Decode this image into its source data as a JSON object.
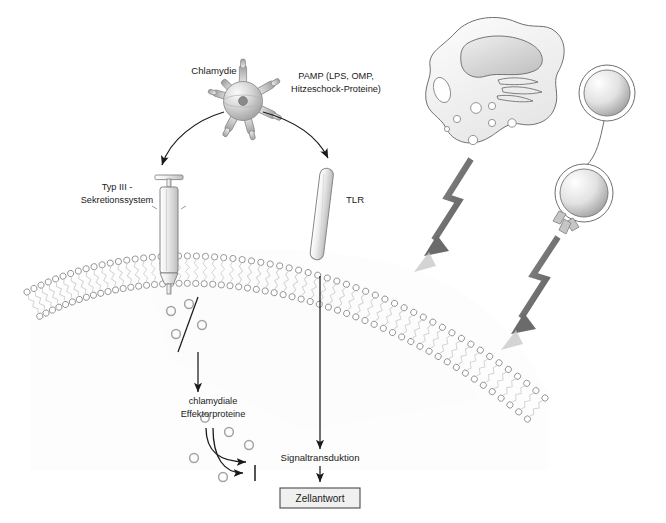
{
  "figure": {
    "language": "de",
    "background_color": "#ffffff",
    "text_color": "#1a1a1a"
  },
  "labels": {
    "chlamydie": "Chlamydie",
    "pamp_line1": "PAMP (LPS, OMP,",
    "pamp_line2": "Hitzeschock-Proteine)",
    "t3ss_line1": "Typ III -",
    "t3ss_line2": "Sekretionssystem",
    "tlr": "TLR",
    "effector_line1": "chlamydiale",
    "effector_line2": "Effektorproteine",
    "signal": "Signaltransduktion",
    "response": "Zellantwort"
  },
  "elements": {
    "pathogen": {
      "name": "Chlamydie",
      "shape": "sphere-with-radiating-needles",
      "needle_count": 6,
      "center": [
        243,
        101
      ],
      "radius": 19,
      "fill_light": "#f2f2f2",
      "fill_dark": "#9a9a9a"
    },
    "secretion_system": {
      "name": "Typ III - Sekretionssystem",
      "shape": "syringe",
      "position": [
        168,
        178
      ],
      "stroke": "#6e6e6e"
    },
    "receptor": {
      "name": "TLR",
      "shape": "rod",
      "position": [
        322,
        170
      ],
      "stroke": "#6e6e6e"
    },
    "membrane": {
      "name": "lipid-bilayer",
      "type": "phospholipid-bilayer",
      "head_color": "#8c8c8c",
      "tail_color": "#cfcfcf",
      "head_count": 58
    },
    "effector_proteins": {
      "shape": "small-rings",
      "count": 9,
      "color": "#a0a0a0"
    },
    "response_box": {
      "label": "Zellantwort",
      "fill": "#f0f0f0",
      "border": "#4a4a4a"
    },
    "immune_cells": [
      {
        "name": "macrophage",
        "shape": "amoeboid-cell-with-nucleus",
        "center": [
          500,
          85
        ]
      },
      {
        "name": "lymphocyte-upper",
        "shape": "round-cell",
        "center": [
          607,
          93
        ],
        "radius": 27
      },
      {
        "name": "lymphocyte-lower",
        "shape": "round-cell-with-antibody",
        "center": [
          584,
          193
        ],
        "radius": 28
      }
    ],
    "bolt_arrows": {
      "name": "zigzag-arrows",
      "count": 2,
      "direction": "down-left",
      "color": "#6b6b6b"
    }
  },
  "arrows": [
    {
      "name": "chlamydie-to-t3ss",
      "from": "Chlamydie",
      "to": "Typ III - Sekretionssystem",
      "style": "curved"
    },
    {
      "name": "chlamydie-to-tlr",
      "from": "Chlamydie",
      "to": "TLR",
      "style": "curved"
    },
    {
      "name": "t3ss-to-effectors",
      "from": "Typ III - Sekretionssystem",
      "to": "chlamydiale Effektorproteine",
      "style": "straight-down"
    },
    {
      "name": "tlr-to-signal",
      "from": "TLR",
      "to": "Signaltransduktion",
      "style": "straight-down-long"
    },
    {
      "name": "signal-to-response",
      "from": "Signaltransduktion",
      "to": "Zellantwort",
      "style": "short-down"
    },
    {
      "name": "effector-activation",
      "from": "chlamydiale Effektorproteine",
      "to": "target",
      "style": "curved-arrowhead"
    },
    {
      "name": "effector-inhibition",
      "from": "chlamydiale Effektorproteine",
      "to": "target",
      "style": "curved-bar-end"
    }
  ]
}
